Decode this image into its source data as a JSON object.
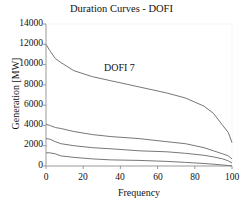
{
  "chart_data": {
    "type": "line",
    "title": "Duration Curves - DOFI",
    "xlabel": "Frequency",
    "ylabel": "Generation [MW]",
    "xlim": [
      0,
      100
    ],
    "ylim": [
      0,
      14000
    ],
    "xticks": [
      0,
      20,
      40,
      60,
      80,
      100
    ],
    "yticks": [
      0,
      2000,
      4000,
      6000,
      8000,
      10000,
      12000,
      14000
    ],
    "grid": false,
    "annotations": [
      {
        "text": "DOFI 7",
        "x": 40,
        "y": 9500
      }
    ],
    "x": [
      0,
      2,
      5,
      8,
      15,
      25,
      35,
      50,
      65,
      75,
      85,
      90,
      95,
      98,
      100
    ],
    "series": [
      {
        "name": "DOFI 7",
        "values": [
          12000,
          11400,
          10600,
          10200,
          9400,
          8800,
          8400,
          7800,
          7200,
          6700,
          5900,
          5200,
          4000,
          3300,
          2300
        ]
      },
      {
        "name": "Curve 2",
        "values": [
          4100,
          4000,
          3800,
          3700,
          3400,
          3100,
          2900,
          2700,
          2400,
          2200,
          1800,
          1500,
          1200,
          1000,
          700
        ]
      },
      {
        "name": "Curve 3",
        "values": [
          2700,
          2650,
          2400,
          2200,
          2000,
          1800,
          1700,
          1500,
          1400,
          1250,
          1050,
          900,
          700,
          500,
          300
        ]
      },
      {
        "name": "Curve 4",
        "values": [
          1300,
          1300,
          1200,
          1000,
          850,
          700,
          600,
          550,
          450,
          350,
          250,
          180,
          100,
          50,
          20
        ]
      }
    ]
  },
  "labels": {
    "title": "Duration Curves - DOFI",
    "xlabel": "Frequency",
    "ylabel": "Generation [MW]",
    "annotation": "DOFI 7",
    "yticks": [
      "14000",
      "12000",
      "10000",
      "8000",
      "6000",
      "4000",
      "2000",
      "0"
    ],
    "xticks": [
      "0",
      "20",
      "40",
      "60",
      "80",
      "100"
    ]
  },
  "colors": {
    "line": "#777777",
    "axis": "#999999"
  }
}
